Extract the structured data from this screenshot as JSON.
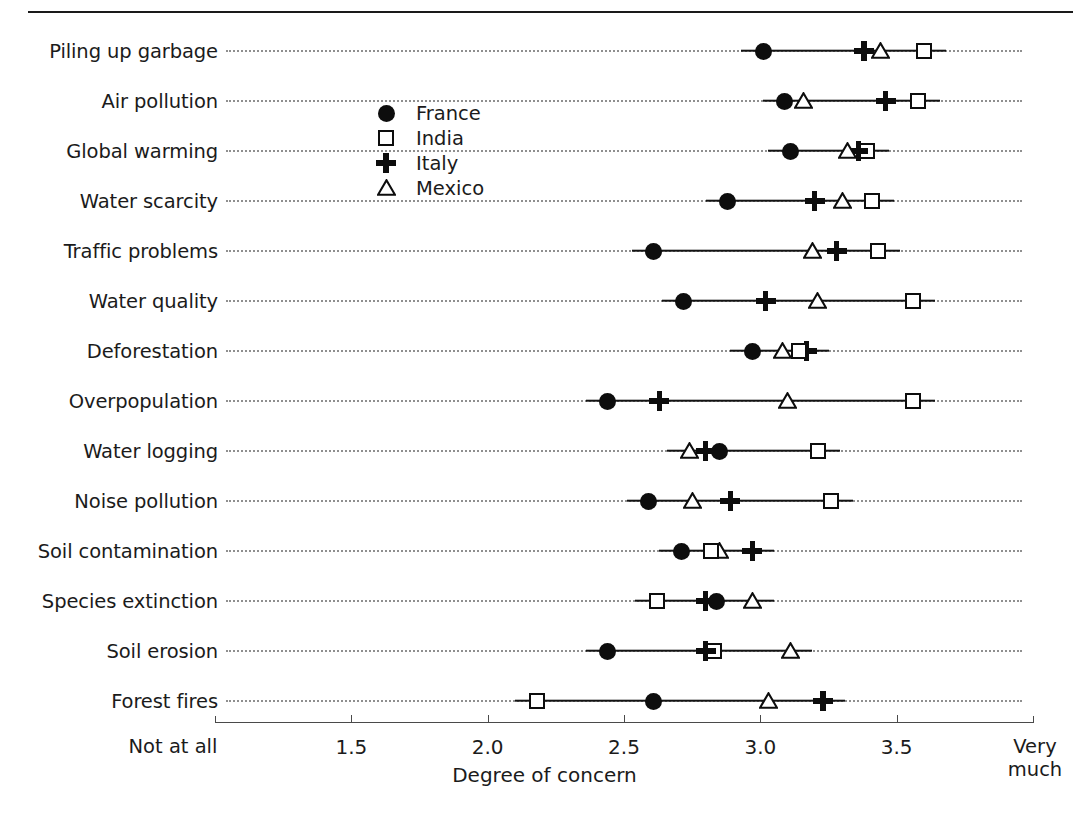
{
  "chart_data": {
    "type": "scatter",
    "title": "",
    "xlabel": "Degree of concern",
    "ylabel": "",
    "xlim": [
      1.0,
      4.0
    ],
    "grid": true,
    "orientation": "horizontal",
    "legend_position": "upper-left-inset",
    "xticks": [
      1.5,
      2.0,
      2.5,
      3.0,
      3.5
    ],
    "xtick_labels": [
      "1.5",
      "2.0",
      "2.5",
      "3.0",
      "3.5"
    ],
    "x_axis_start_label": "Not at all",
    "x_axis_end_label": "Very much",
    "categories": [
      "Piling up garbage",
      "Air pollution",
      "Global warming",
      "Water scarcity",
      "Traffic problems",
      "Water quality",
      "Deforestation",
      "Overpopulation",
      "Water logging",
      "Noise pollution",
      "Soil contamination",
      "Species extinction",
      "Soil erosion",
      "Forest fires"
    ],
    "series": [
      {
        "name": "France",
        "marker": "filled-circle",
        "values": [
          3.01,
          3.09,
          3.11,
          2.88,
          2.61,
          2.72,
          2.97,
          2.44,
          2.85,
          2.59,
          2.71,
          2.84,
          2.44,
          2.61
        ]
      },
      {
        "name": "India",
        "marker": "open-square",
        "values": [
          3.6,
          3.58,
          3.39,
          3.41,
          3.43,
          3.56,
          3.14,
          3.56,
          3.21,
          3.26,
          2.82,
          2.62,
          2.83,
          2.18
        ]
      },
      {
        "name": "Italy",
        "marker": "plus",
        "values": [
          3.38,
          3.46,
          3.36,
          3.2,
          3.28,
          3.02,
          3.17,
          2.63,
          2.8,
          2.89,
          2.97,
          2.8,
          2.8,
          3.23
        ]
      },
      {
        "name": "Mexico",
        "marker": "open-triangle",
        "values": [
          3.44,
          3.16,
          3.32,
          3.3,
          3.19,
          3.21,
          3.08,
          3.1,
          2.74,
          2.75,
          2.85,
          2.97,
          3.11,
          3.03
        ]
      }
    ]
  },
  "legend": {
    "entries": [
      {
        "label": "France",
        "marker": "filled-circle"
      },
      {
        "label": "India",
        "marker": "open-square"
      },
      {
        "label": "Italy",
        "marker": "plus"
      },
      {
        "label": "Mexico",
        "marker": "open-triangle"
      }
    ]
  },
  "axis": {
    "xlabel": "Degree of concern",
    "start_label": "Not at all",
    "end_label_line1": "Very",
    "end_label_line2": "much",
    "tick_labels": [
      "1.5",
      "2.0",
      "2.5",
      "3.0",
      "3.5"
    ]
  },
  "colors": {
    "marker": "#0d0d0d",
    "line": "#131313",
    "grid": "#8f8f8f",
    "text": "#1b1b1b",
    "background": "#ffffff"
  }
}
